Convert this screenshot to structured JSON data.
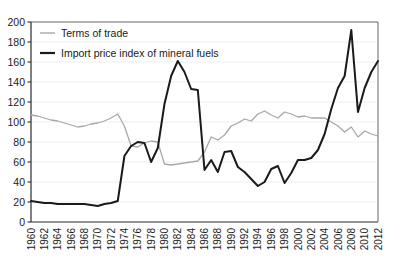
{
  "chart_data": {
    "type": "line",
    "title": "",
    "subtitle": "",
    "xlabel": "",
    "ylabel": "",
    "xlim": [
      1960,
      2012
    ],
    "ylim": [
      0,
      200
    ],
    "grid": "horizontal",
    "legend_position": "top-left-inside",
    "y_ticks": [
      0,
      20,
      40,
      60,
      80,
      100,
      120,
      140,
      160,
      180,
      200
    ],
    "y_tick_labels": [
      "0",
      "20",
      "40",
      "60",
      "80",
      "100",
      "120",
      "140",
      "160",
      "180",
      "200"
    ],
    "x_tick_labels": [
      "1960",
      "1962",
      "1964",
      "1966",
      "1968",
      "1970",
      "1972",
      "1974",
      "1976",
      "1978",
      "1980",
      "1982",
      "1984",
      "1986",
      "1988",
      "1990",
      "1992",
      "1994",
      "1996",
      "1998",
      "2000",
      "2002",
      "2004",
      "2006",
      "2008",
      "2010",
      "2012"
    ],
    "x": [
      1960,
      1961,
      1962,
      1963,
      1964,
      1965,
      1966,
      1967,
      1968,
      1969,
      1970,
      1971,
      1972,
      1973,
      1974,
      1975,
      1976,
      1977,
      1978,
      1979,
      1980,
      1981,
      1982,
      1983,
      1984,
      1985,
      1986,
      1987,
      1988,
      1989,
      1990,
      1991,
      1992,
      1993,
      1994,
      1995,
      1996,
      1997,
      1998,
      1999,
      2000,
      2001,
      2002,
      2003,
      2004,
      2005,
      2006,
      2007,
      2008,
      2009,
      2010,
      2011,
      2012
    ],
    "series": [
      {
        "name": "Terms of trade",
        "color": "#a8a8a8",
        "width": 1.3,
        "values": [
          107,
          106,
          104,
          102,
          101,
          99,
          97,
          95,
          96,
          98,
          99,
          101,
          104,
          108,
          96,
          76,
          75,
          79,
          81,
          80,
          58,
          57,
          58,
          59,
          60,
          61,
          70,
          85,
          82,
          87,
          96,
          99,
          103,
          101,
          108,
          111,
          107,
          104,
          110,
          108,
          105,
          106,
          104,
          104,
          104,
          100,
          96,
          90,
          95,
          85,
          91,
          88,
          86
        ]
      },
      {
        "name": "Import price index of mineral fuels",
        "color": "#1a1a1a",
        "width": 2.0,
        "values": [
          21,
          20,
          19,
          19,
          18,
          18,
          18,
          18,
          18,
          17,
          16,
          18,
          19,
          21,
          66,
          76,
          80,
          79,
          60,
          74,
          118,
          146,
          161,
          150,
          133,
          132,
          52,
          62,
          50,
          70,
          71,
          55,
          50,
          43,
          36,
          40,
          53,
          56,
          39,
          49,
          62,
          62,
          64,
          72,
          88,
          113,
          134,
          146,
          192,
          110,
          134,
          150,
          161
        ]
      }
    ],
    "legend": [
      {
        "label": "Terms of trade",
        "color": "#a8a8a8"
      },
      {
        "label": "Import price index of mineral fuels",
        "color": "#1a1a1a"
      }
    ]
  }
}
